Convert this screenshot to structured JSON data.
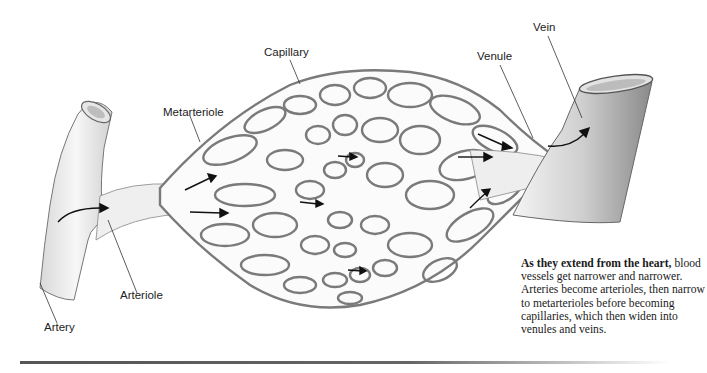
{
  "diagram": {
    "labels": {
      "capillary": "Capillary",
      "metarteriole": "Metarteriole",
      "arteriole": "Arteriole",
      "artery": "Artery",
      "venule": "Venule",
      "vein": "Vein"
    },
    "caption": {
      "bold": "As they extend from the heart,",
      "text": " blood vessels get narrower and narrower. Arteries become arterioles, then narrow to metarterioles before becoming capillaries, which then widen into venules and veins."
    },
    "colors": {
      "vessel_fill": "#f2f2f2",
      "vessel_stroke": "#6b6b6b",
      "mesh_stroke": "#7a7a7a",
      "arrow": "#111111",
      "text": "#222222"
    }
  }
}
